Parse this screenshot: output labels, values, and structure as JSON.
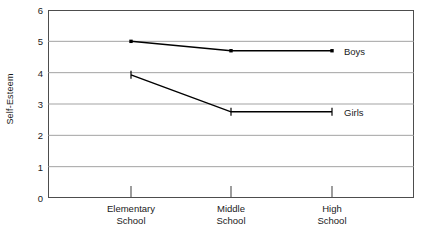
{
  "chart_data": {
    "type": "line",
    "title": "",
    "subtitle": "",
    "xlabel": "",
    "ylabel": "Self-Esteem",
    "categories": [
      "Elementary School",
      "Middle School",
      "High School"
    ],
    "category_lines": [
      [
        "Elementary",
        "School"
      ],
      [
        "Middle",
        "School"
      ],
      [
        "High",
        "School"
      ]
    ],
    "ylim": [
      0,
      6
    ],
    "yticks": [
      0,
      1,
      2,
      3,
      4,
      5,
      6
    ],
    "ytick_labels": [
      "0",
      "1",
      "2",
      "3",
      "4",
      "5",
      "6"
    ],
    "grid": "horizontal",
    "legend_position": "inline-right-end-of-line",
    "series": [
      {
        "name": "Boys",
        "values": [
          5.0,
          4.7,
          4.7
        ],
        "marker": "square-dot",
        "color": "#000000",
        "label": "Boys"
      },
      {
        "name": "Girls",
        "values": [
          3.93,
          2.75,
          2.75
        ],
        "marker": "vertical-tick",
        "color": "#000000",
        "label": "Girls"
      }
    ]
  },
  "axes": {
    "y_title": "Self-Esteem",
    "frame_color": "#4d4d4d",
    "gridline_color": "#999999"
  }
}
